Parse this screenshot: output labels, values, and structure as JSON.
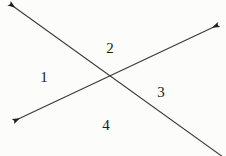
{
  "figure": {
    "canvas": {
      "width": 226,
      "height": 156
    },
    "background_color": "#fcfcfa",
    "stroke_color": "#3a3a3a",
    "label_color": "#1b1b1b",
    "intersection": {
      "x": 111,
      "y": 78
    },
    "lines": [
      {
        "id": "line-ascending",
        "description": "Line rising from lower-left to upper-right with arrowheads on both ends",
        "x1": 14,
        "y1": 121,
        "x2": 218,
        "y2": 25,
        "arrow_start": true,
        "arrow_end": true,
        "stroke_width": 1.1
      },
      {
        "id": "line-descending",
        "description": "Line falling from upper-left to lower-right, arrowhead at upper-left only, running off the lower-right edge",
        "x1": 10,
        "y1": 4,
        "x2": 223,
        "y2": 157,
        "arrow_start": true,
        "arrow_end": false,
        "stroke_width": 1.1
      }
    ],
    "labels": [
      {
        "id": "angle-1",
        "text": "1",
        "x": 44,
        "y": 77,
        "region": "left"
      },
      {
        "id": "angle-2",
        "text": "2",
        "x": 110,
        "y": 48,
        "region": "top"
      },
      {
        "id": "angle-3",
        "text": "3",
        "x": 161,
        "y": 92,
        "region": "right"
      },
      {
        "id": "angle-4",
        "text": "4",
        "x": 106,
        "y": 125,
        "region": "bottom"
      }
    ]
  }
}
